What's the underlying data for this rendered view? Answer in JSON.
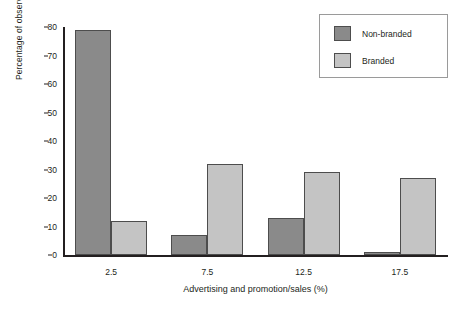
{
  "chart_data": {
    "type": "bar",
    "title": "",
    "xlabel": "Advertising and promotion/sales (%)",
    "ylabel": "Percentage of observations",
    "categories": [
      "2.5",
      "7.5",
      "12.5",
      "17.5"
    ],
    "series": [
      {
        "name": "Non-branded",
        "color": "#8a8a8a",
        "values": [
          79,
          7,
          13,
          1
        ]
      },
      {
        "name": "Branded",
        "color": "#c4c4c4",
        "values": [
          12,
          32,
          29,
          27
        ]
      }
    ],
    "ylim": [
      0,
      80
    ],
    "yticks": [
      "0",
      "10",
      "20",
      "30",
      "40",
      "50",
      "60",
      "70",
      "80"
    ],
    "ytick_values": [
      0,
      10,
      20,
      30,
      40,
      50,
      60,
      70,
      80
    ],
    "grid": false,
    "legend_position": "top-right",
    "legend_entries": [
      "Non-branded",
      "Branded"
    ]
  }
}
